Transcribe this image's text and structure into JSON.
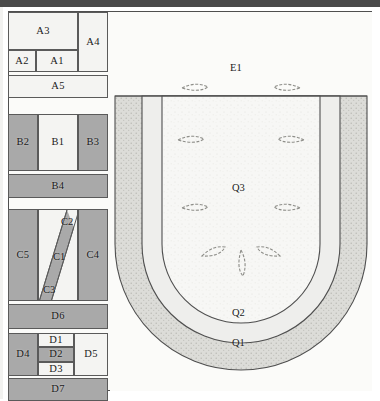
{
  "figure": {
    "type": "geological-cross-section-diagram",
    "left_panel": {
      "name": "lettered-block-column",
      "blocks": [
        {
          "id": "A3",
          "label": "A3",
          "tone": "light"
        },
        {
          "id": "A4",
          "label": "A4",
          "tone": "light"
        },
        {
          "id": "A2",
          "label": "A2",
          "tone": "light"
        },
        {
          "id": "A1",
          "label": "A1",
          "tone": "light"
        },
        {
          "id": "A5",
          "label": "A5",
          "tone": "light"
        },
        {
          "id": "B2",
          "label": "B2",
          "tone": "dark"
        },
        {
          "id": "B1",
          "label": "B1",
          "tone": "light"
        },
        {
          "id": "B3",
          "label": "B3",
          "tone": "dark"
        },
        {
          "id": "B4",
          "label": "B4",
          "tone": "dark"
        },
        {
          "id": "C5",
          "label": "C5",
          "tone": "dark"
        },
        {
          "id": "C2",
          "label": "C2",
          "tone": "light"
        },
        {
          "id": "C1",
          "label": "C1",
          "tone": "dark"
        },
        {
          "id": "C3",
          "label": "C3",
          "tone": "light"
        },
        {
          "id": "C4",
          "label": "C4",
          "tone": "dark"
        },
        {
          "id": "D6",
          "label": "D6",
          "tone": "dark"
        },
        {
          "id": "D4",
          "label": "D4",
          "tone": "dark"
        },
        {
          "id": "D1",
          "label": "D1",
          "tone": "light"
        },
        {
          "id": "D2",
          "label": "D2",
          "tone": "dark"
        },
        {
          "id": "D3",
          "label": "D3",
          "tone": "light"
        },
        {
          "id": "D5",
          "label": "D5",
          "tone": "light"
        },
        {
          "id": "D7",
          "label": "D7",
          "tone": "dark"
        }
      ]
    },
    "right_panel": {
      "name": "u-shaped-basin",
      "background_label": "E1",
      "layers": [
        {
          "id": "Q1",
          "label": "Q1",
          "description": "outer stippled band"
        },
        {
          "id": "Q2",
          "label": "Q2",
          "description": "middle light band"
        },
        {
          "id": "Q3",
          "label": "Q3",
          "description": "inner speckled core"
        }
      ],
      "arrows": [
        {
          "id": "arrow-left-1",
          "direction": "right"
        },
        {
          "id": "arrow-left-2",
          "direction": "right"
        },
        {
          "id": "arrow-left-3",
          "direction": "right"
        },
        {
          "id": "arrow-left-4",
          "direction": "up-right"
        },
        {
          "id": "arrow-right-1",
          "direction": "left"
        },
        {
          "id": "arrow-right-2",
          "direction": "left"
        },
        {
          "id": "arrow-right-3",
          "direction": "left"
        },
        {
          "id": "arrow-right-4",
          "direction": "up-left"
        },
        {
          "id": "arrow-bottom-center",
          "direction": "up"
        }
      ]
    },
    "colors": {
      "dark_fill": "#a9a9a9",
      "light_fill": "#f4f4f2",
      "outline": "#5a5a5a",
      "frame": "#4f4f4f",
      "topbar": "#4a4a4a",
      "q1_fill": "#d8d8d4",
      "q2_fill": "#eeeeec",
      "q3_fill": "#f7f7f5"
    }
  }
}
